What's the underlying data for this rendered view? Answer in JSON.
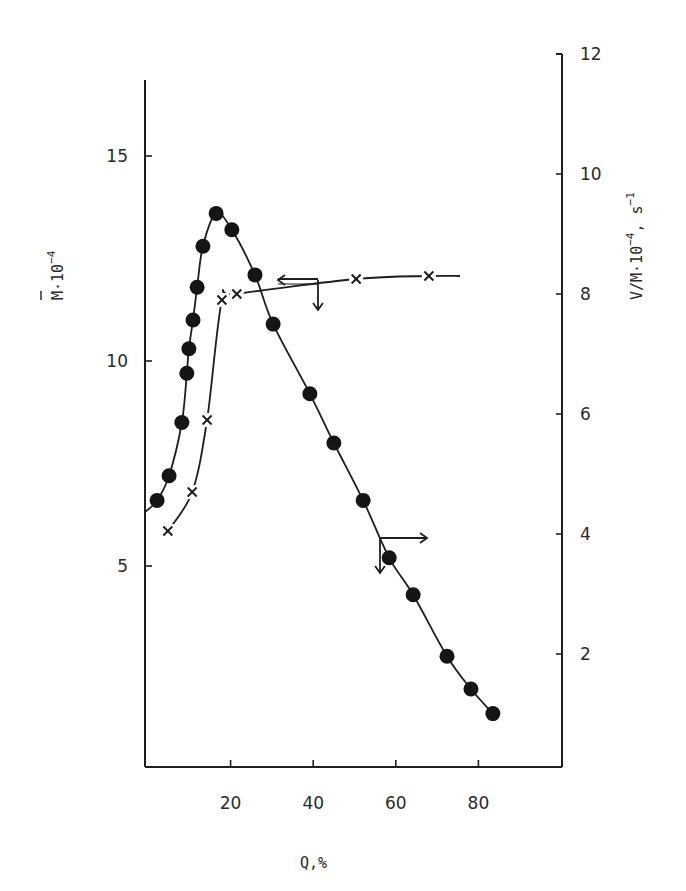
{
  "chart_data": {
    "type": "line",
    "title": "",
    "xlabel": "Q,%",
    "ylabel_left": "M̄·10^-4",
    "ylabel_right": "V/M·10^-4, s^-1",
    "xlim": [
      0,
      95
    ],
    "ylim_left": [
      0,
      18
    ],
    "ylim_right": [
      0,
      12
    ],
    "x_ticks": [
      20,
      40,
      60,
      80
    ],
    "y_ticks_left": [
      5,
      10,
      15
    ],
    "y_ticks_right": [
      2,
      4,
      6,
      8,
      10,
      12
    ],
    "grid": false,
    "legend": null,
    "series": [
      {
        "name": "M̄·10^-4 (molecular weight)",
        "axis": "left",
        "marker": "filled-circle",
        "x": [
          2.2,
          5.1,
          8.2,
          9.4,
          9.9,
          10.9,
          11.9,
          13.3,
          16.5,
          20.3,
          25.9,
          30.3,
          39.2,
          45.0,
          52.1,
          58.4,
          64.2,
          72.4,
          78.2,
          83.5
        ],
        "values": [
          6.6,
          7.2,
          8.5,
          9.7,
          10.3,
          11.0,
          11.8,
          12.8,
          13.6,
          13.2,
          12.1,
          10.9,
          9.2,
          8.0,
          6.6,
          5.2,
          4.3,
          2.8,
          2.0,
          1.4
        ]
      },
      {
        "name": "V/M·10^-4, s^-1",
        "axis": "right",
        "marker": "x",
        "x": [
          4.8,
          10.7,
          14.3,
          17.9,
          21.5,
          50.4,
          68.0
        ],
        "values": [
          4.05,
          4.7,
          5.9,
          7.9,
          8.0,
          8.25,
          8.3
        ]
      }
    ],
    "annotations": [
      {
        "type": "arrow",
        "description": "left arrow near V-curve pointing to left axis, with down arrow",
        "at_x": 41,
        "at_y_right": 8.2
      },
      {
        "type": "arrow",
        "description": "right arrow near M-curve pointing to right axis, with down arrow",
        "at_x": 56,
        "at_y_left": 5.6
      }
    ]
  },
  "labels": {
    "x_axis": "Q,%",
    "left_axis_main": "M·10",
    "left_axis_exp": "−4",
    "right_axis_main": "V/M·10",
    "right_axis_exp": "−4",
    "right_axis_tail": ", s",
    "right_axis_tail_exp": "−1"
  }
}
